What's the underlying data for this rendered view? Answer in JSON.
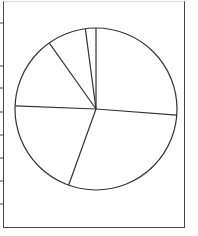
{
  "chart_data": {
    "type": "pie",
    "title": "",
    "labels": [
      "",
      "",
      "",
      "",
      "",
      ""
    ],
    "values": [
      26.2,
      29.3,
      20.1,
      14.6,
      7.7,
      2.1
    ],
    "start_angle_deg": 0,
    "direction": "clockwise",
    "legend": null,
    "colors": {
      "fill": "#ffffff",
      "stroke": "#333333"
    },
    "left_axis_ticks_y_px": [
      23,
      66,
      88,
      112,
      135,
      158,
      181,
      204
    ]
  }
}
